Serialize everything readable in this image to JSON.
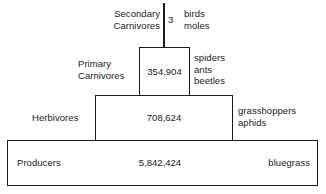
{
  "diagram": {
    "type": "ecological-pyramid-of-numbers",
    "background_color": "#ffffff",
    "line_color": "#1a1a1a",
    "text_color": "#1a1a1a"
  },
  "levels": {
    "secondary_carnivores": {
      "label": "Secondary\nCarnivores",
      "value": "3",
      "organisms": "birds\nmoles"
    },
    "primary_carnivores": {
      "label": "Primary\nCarnivores",
      "value": "354,904",
      "organisms": "spiders\nants\nbeetles"
    },
    "herbivores": {
      "label": "Herbivores",
      "value": "708,624",
      "organisms": "grasshoppers\naphids"
    },
    "producers": {
      "label": "Producers",
      "value": "5,842,424",
      "organisms": "bluegrass"
    }
  },
  "chart_data": {
    "type": "bar",
    "title": "",
    "xlabel": "",
    "ylabel": "Trophic level",
    "categories": [
      "Producers",
      "Herbivores",
      "Primary Carnivores",
      "Secondary Carnivores"
    ],
    "values": [
      5842424,
      708624,
      354904,
      3
    ],
    "value_labels": [
      "5,842,424",
      "708,624",
      "354,904",
      "3"
    ],
    "organism_labels": [
      "bluegrass",
      "grasshoppers, aphids",
      "spiders, ants, beetles",
      "birds, moles"
    ],
    "grid": false,
    "legend": "none",
    "orientation": "pyramid"
  }
}
